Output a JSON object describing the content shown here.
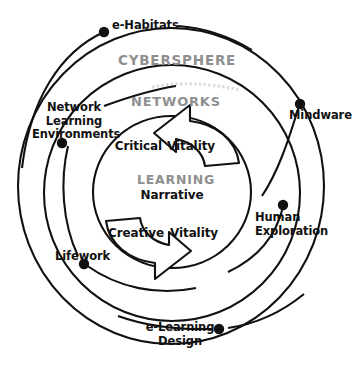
{
  "figure": {
    "background_color": "#ffffff",
    "stroke_color": "#111111",
    "ring_label_color": "#8f8f8f",
    "text_color": "#111111"
  },
  "rings": [
    {
      "key": "cybersphere",
      "label": "CYBERSPHERE"
    },
    {
      "key": "networks",
      "label": "NETWORKS"
    },
    {
      "key": "learning",
      "label": "LEARNING"
    }
  ],
  "ring_labels": {
    "cybersphere": "CYBERSPHERE",
    "networks": "NETWORKS",
    "learning": "LEARNING"
  },
  "center": {
    "core_label": "Narrative",
    "top_left_label": "Critical",
    "top_right_label": "Vitality",
    "bottom_left_label": "Creative",
    "bottom_right_label": "Vitality"
  },
  "nodes": [
    {
      "id": "e-habitats",
      "label": "e-Habitats",
      "lines": [
        "e-Habitats"
      ],
      "ring": "cybersphere"
    },
    {
      "id": "mindware",
      "label": "Mindware",
      "lines": [
        "Mindware"
      ],
      "ring": "cybersphere"
    },
    {
      "id": "human-exploration",
      "label": "Human Exploration",
      "lines": [
        "Human",
        "Exploration"
      ],
      "ring": "cybersphere"
    },
    {
      "id": "e-learning-design",
      "label": "e-Learning Design",
      "lines": [
        "e-Learning",
        "Design"
      ],
      "ring": "cybersphere"
    },
    {
      "id": "lifework",
      "label": "Lifework",
      "lines": [
        "Lifework"
      ],
      "ring": "networks"
    },
    {
      "id": "network-learning-environments",
      "label": "Network Learning Environments",
      "lines": [
        "Network",
        "Learning",
        "Environments"
      ],
      "ring": "networks"
    }
  ],
  "node_labels": {
    "e_habitats": "e-Habitats",
    "mindware": "Mindware",
    "human_line1": "Human",
    "human_line2": "Exploration",
    "elearning_line1": "e-Learning",
    "elearning_line2": "Design",
    "lifework": "Lifework",
    "nle_line1": "Network",
    "nle_line2": "Learning",
    "nle_line3": "Environments"
  }
}
